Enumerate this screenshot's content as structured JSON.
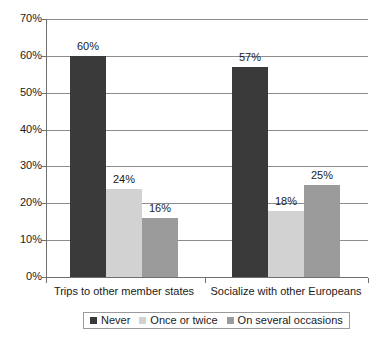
{
  "chart_data": {
    "type": "bar",
    "title": "",
    "xlabel": "",
    "ylabel": "",
    "ylim": [
      0,
      70
    ],
    "grid": true,
    "legend_position": "bottom",
    "categories": [
      "Trips to other member states",
      "Socialize with other Europeans"
    ],
    "y_ticks": [
      "0%",
      "10%",
      "20%",
      "30%",
      "40%",
      "50%",
      "60%",
      "70%"
    ],
    "y_tick_values": [
      0,
      10,
      20,
      30,
      40,
      50,
      60,
      70
    ],
    "series": [
      {
        "name": "Never",
        "color": "#3a3a3a",
        "values": [
          60,
          57
        ],
        "labels": [
          "60%",
          "57%"
        ]
      },
      {
        "name": "Once or twice",
        "color": "#d2d2d2",
        "values": [
          24,
          18
        ],
        "labels": [
          "24%",
          "18%"
        ]
      },
      {
        "name": "On several occasions",
        "color": "#9b9b9b",
        "values": [
          16,
          25
        ],
        "labels": [
          "16%",
          "25%"
        ]
      }
    ]
  },
  "legend": {
    "items": [
      {
        "label": "Never"
      },
      {
        "label": "Once or twice"
      },
      {
        "label": "On several occasions"
      }
    ]
  }
}
